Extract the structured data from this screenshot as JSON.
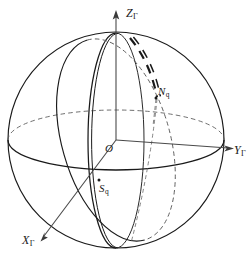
{
  "figure": {
    "kind": "celestial-sphere-coordinate-diagram",
    "background_color": "#ffffff",
    "line_color": "#1a1a1a",
    "axis_color": "#4a4a4a",
    "labels": {
      "z_axis": {
        "base": "Z",
        "sub": "Γ"
      },
      "y_axis": {
        "base": "Y",
        "sub": "Γ"
      },
      "x_axis": {
        "base": "X",
        "sub": "Γ"
      },
      "origin": {
        "base": "O",
        "sub": ""
      },
      "north_point": {
        "base": "N",
        "sub": "q"
      },
      "south_point": {
        "base": "S",
        "sub": "q"
      }
    },
    "geometry": {
      "center_x": 116,
      "center_y": 140,
      "radius": 108,
      "north_pole_x": 116,
      "north_pole_y": 33,
      "south_pole_x": 116,
      "south_pole_y": 248,
      "equator_rx": 108,
      "equator_ry": 30,
      "meridian_rx": 28,
      "meridian_ry": 108,
      "tilted_rx": 54,
      "tilted_ry": 104,
      "tilted_rotation_deg": -16
    },
    "axes": {
      "z_tip_x": 116,
      "z_tip_y": 12,
      "y_tip_x": 231,
      "y_tip_y": 148,
      "x_tip_x": 44,
      "x_tip_y": 238
    }
  }
}
